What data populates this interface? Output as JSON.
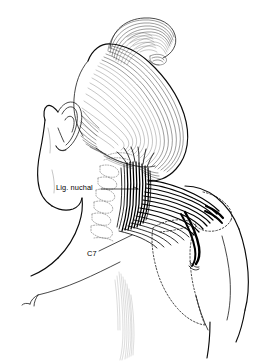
{
  "figure": {
    "kind": "anatomical-line-illustration",
    "background_color": "#ffffff",
    "ink_color": "#000000",
    "width": 276,
    "height": 364
  },
  "labels": [
    {
      "id": "lig-nuchal",
      "text": "Lig. nuchal",
      "x": 56,
      "y": 184,
      "leader": "horizontal line extending right to the nuchal ligament"
    },
    {
      "id": "c7",
      "text": "C7",
      "x": 87,
      "y": 250,
      "leader": "oblique line extending up-right to the C7 spinous process"
    }
  ],
  "regions": [
    {
      "id": "hair-bun",
      "name": "Hair bun",
      "rendering": "fine curved pen hatching"
    },
    {
      "id": "hair-mass",
      "name": "Occipital hair mass",
      "rendering": "long parallel curved strokes"
    },
    {
      "id": "ear",
      "name": "Ear (auricle)",
      "rendering": "contour line drawing"
    },
    {
      "id": "face-profile",
      "name": "Face and jaw profile",
      "rendering": "single contour line"
    },
    {
      "id": "nuchal-ligament",
      "name": "Ligamentum nuchae",
      "rendering": "dense black vertical fibers"
    },
    {
      "id": "trapezius",
      "name": "Trapezius muscle",
      "rendering": "dense black fibers radiating toward the shoulder"
    },
    {
      "id": "cervical-vertebrae",
      "name": "Cervical spinous processes",
      "rendering": "light dotted outlines"
    },
    {
      "id": "scapula",
      "name": "Scapula",
      "rendering": "dashed subcutaneous outline"
    },
    {
      "id": "clavicle",
      "name": "Clavicle",
      "rendering": "thin contour line at left shoulder"
    },
    {
      "id": "back-midline",
      "name": "Back midline hatching",
      "rendering": "faint vertical hatching"
    }
  ]
}
